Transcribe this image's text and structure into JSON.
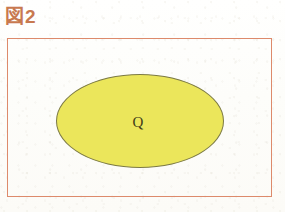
{
  "figure": {
    "caption": {
      "kanji": "図",
      "number": "2",
      "full_text": "図2",
      "color": "#c8794f"
    },
    "frame": {
      "name": "universal-set-rectangle",
      "border_color": "#dd8a6b",
      "fill_color": "transparent"
    },
    "sets": [
      {
        "label": "Q",
        "shape": "ellipse",
        "fill_color": "#ebe65b",
        "border_color": "#7c7a45",
        "label_color": "#403c18"
      }
    ],
    "background_color": "#fefefc"
  }
}
